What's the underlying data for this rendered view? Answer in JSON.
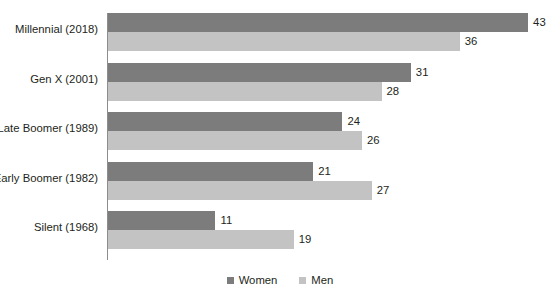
{
  "chart_data": {
    "type": "bar",
    "orientation": "horizontal",
    "title": "",
    "xlabel": "",
    "ylabel": "",
    "grid": false,
    "legend_position": "bottom-center",
    "xlim": [
      0,
      43
    ],
    "categories": [
      "Millennial (2018)",
      "Gen X (2001)",
      "Late Boomer (1989)",
      "Early Boomer (1982)",
      "Silent (1968)"
    ],
    "series": [
      {
        "name": "Women",
        "color": "#7c7c7c",
        "values": [
          43,
          31,
          24,
          21,
          11
        ]
      },
      {
        "name": "Men",
        "color": "#c3c3c3",
        "values": [
          36,
          28,
          26,
          27,
          19
        ]
      }
    ]
  },
  "legend": {
    "items": [
      {
        "label": "Women",
        "color": "#7c7c7c"
      },
      {
        "label": "Men",
        "color": "#c3c3c3"
      }
    ]
  }
}
